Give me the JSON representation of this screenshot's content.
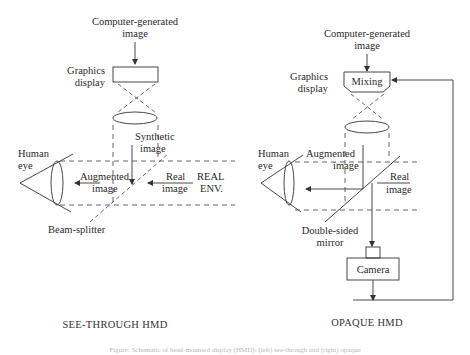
{
  "left_panel": {
    "title": "SEE-THROUGH HMD",
    "input_label_line1": "Computer-generated",
    "input_label_line2": "image",
    "display_label_line1": "Graphics",
    "display_label_line2": "display",
    "synthetic_line1": "Synthetic",
    "synthetic_line2": "image",
    "eye_line1": "Human",
    "eye_line2": "eye",
    "augmented_line1": "Augmented",
    "augmented_line2": "image",
    "real_line1": "Real",
    "real_line2": "image",
    "env_line1": "REAL",
    "env_line2": "ENV.",
    "splitter": "Beam-splitter"
  },
  "right_panel": {
    "title": "OPAQUE HMD",
    "input_label_line1": "Computer-generated",
    "input_label_line2": "image",
    "display_label_line1": "Graphics",
    "display_label_line2": "display",
    "mixing": "Mixing",
    "eye_line1": "Human",
    "eye_line2": "eye",
    "augmented_line1": "Augmented",
    "augmented_line2": "image",
    "real_line1": "Real",
    "real_line2": "image",
    "mirror_line1": "Double-sided",
    "mirror_line2": "mirror",
    "camera": "Camera"
  },
  "caption": "Figure: Schematic of head-mounted display (HMD): (left) see-through and (right) opaque"
}
